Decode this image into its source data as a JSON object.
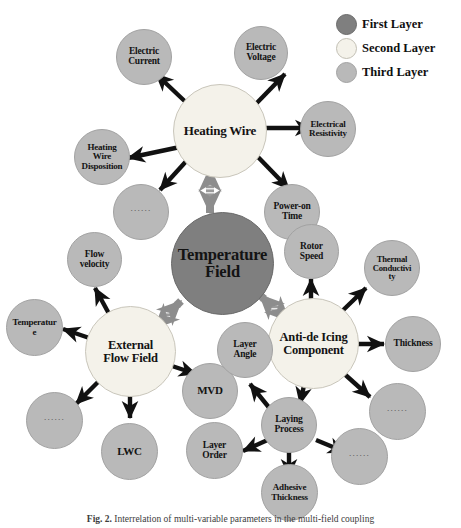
{
  "legend": {
    "items": [
      {
        "label": "First Layer",
        "color": "#7f7f7f"
      },
      {
        "label": "Second Layer",
        "color": "#f4f2ea"
      },
      {
        "label": "Third Layer",
        "color": "#b9b9b9"
      }
    ]
  },
  "caption": {
    "prefix": "Fig. 2.",
    "text": "Interrelation of multi-variable parameters in the multi-field coupling"
  },
  "ellipsis": "······",
  "center": {
    "label_line1": "Temperature",
    "label_line2": "Field"
  },
  "hubs": [
    {
      "id": "heating-wire",
      "label_line1": "Heating Wire",
      "label_line2": ""
    },
    {
      "id": "external-flow",
      "label_line1": "External",
      "label_line2": "Flow Field"
    },
    {
      "id": "anti-de-icing",
      "label_line1": "Anti-de Icing",
      "label_line2": "Component"
    }
  ],
  "heating_wire_children": [
    {
      "id": "electric-current",
      "l1": "Electric",
      "l2": "Current",
      "l3": ""
    },
    {
      "id": "electric-voltage",
      "l1": "Electric",
      "l2": "Voltage",
      "l3": ""
    },
    {
      "id": "electrical-resistivity",
      "l1": "Electrical",
      "l2": "Resistivity",
      "l3": ""
    },
    {
      "id": "power-on-time",
      "l1": "Power-on",
      "l2": "Time",
      "l3": ""
    },
    {
      "id": "heating-wire-disposition",
      "l1": "Heating",
      "l2": "Wire",
      "l3": "Disposition"
    },
    {
      "id": "heating-wire-more",
      "l1": "",
      "l2": "",
      "l3": ""
    }
  ],
  "external_flow_children": [
    {
      "id": "flow-velocity",
      "l1": "Flow",
      "l2": "velocity",
      "l3": ""
    },
    {
      "id": "temperature",
      "l1": "Temperatur",
      "l2": "e",
      "l3": ""
    },
    {
      "id": "mvd",
      "l1": "MVD",
      "l2": "",
      "l3": ""
    },
    {
      "id": "lwc",
      "l1": "LWC",
      "l2": "",
      "l3": ""
    },
    {
      "id": "external-flow-more",
      "l1": "",
      "l2": "",
      "l3": ""
    }
  ],
  "anti_de_icing_children": [
    {
      "id": "rotor-speed",
      "l1": "Rotor",
      "l2": "Speed",
      "l3": ""
    },
    {
      "id": "thermal-conductivity",
      "l1": "Thermal",
      "l2": "Conductivi",
      "l3": "ty"
    },
    {
      "id": "thickness",
      "l1": "Thickness",
      "l2": "",
      "l3": ""
    },
    {
      "id": "layer-angle",
      "l1": "Layer",
      "l2": "Angle",
      "l3": ""
    },
    {
      "id": "laying-process",
      "l1": "Laying",
      "l2": "Process",
      "l3": ""
    },
    {
      "id": "anti-de-icing-more",
      "l1": "",
      "l2": "",
      "l3": ""
    }
  ],
  "laying_process_children": [
    {
      "id": "layer-order",
      "l1": "Layer",
      "l2": "Order",
      "l3": ""
    },
    {
      "id": "adhesive-thickness",
      "l1": "Adhesive",
      "l2": "Thickness",
      "l3": ""
    },
    {
      "id": "laying-process-more",
      "l1": "",
      "l2": "",
      "l3": ""
    }
  ]
}
